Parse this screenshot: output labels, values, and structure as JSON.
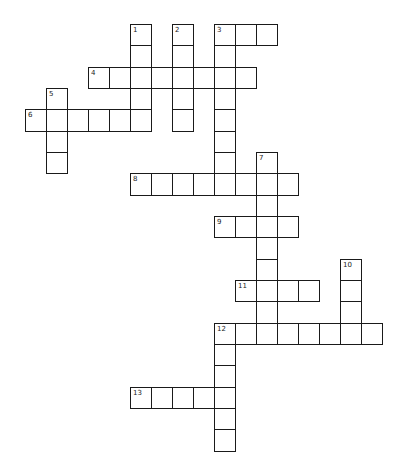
{
  "puzzle": {
    "grid": {
      "origin_x": 25,
      "origin_y": 24,
      "cell_w": 21,
      "cell_h": 21.33,
      "line_color": "#1a1a1a",
      "fill_color": "#ffffff"
    },
    "entries": [
      {
        "number": "1",
        "direction": "down",
        "col": 5,
        "row": 0,
        "length": 5
      },
      {
        "number": "2",
        "direction": "down",
        "col": 7,
        "row": 0,
        "length": 5
      },
      {
        "number": "3",
        "direction": "across",
        "col": 9,
        "row": 0,
        "length": 3
      },
      {
        "number": "3",
        "direction": "down",
        "col": 9,
        "row": 0,
        "length": 8
      },
      {
        "number": "4",
        "direction": "across",
        "col": 3,
        "row": 2,
        "length": 8
      },
      {
        "number": "5",
        "direction": "down",
        "col": 1,
        "row": 3,
        "length": 4
      },
      {
        "number": "6",
        "direction": "across",
        "col": 0,
        "row": 4,
        "length": 6
      },
      {
        "number": "7",
        "direction": "down",
        "col": 11,
        "row": 6,
        "length": 9
      },
      {
        "number": "8",
        "direction": "across",
        "col": 5,
        "row": 7,
        "length": 8
      },
      {
        "number": "9",
        "direction": "across",
        "col": 9,
        "row": 9,
        "length": 4
      },
      {
        "number": "10",
        "direction": "down",
        "col": 15,
        "row": 11,
        "length": 4
      },
      {
        "number": "11",
        "direction": "across",
        "col": 10,
        "row": 12,
        "length": 4
      },
      {
        "number": "12",
        "direction": "across",
        "col": 9,
        "row": 14,
        "length": 8
      },
      {
        "number": "12",
        "direction": "down",
        "col": 9,
        "row": 14,
        "length": 6
      },
      {
        "number": "13",
        "direction": "across",
        "col": 5,
        "row": 17,
        "length": 5
      }
    ]
  }
}
